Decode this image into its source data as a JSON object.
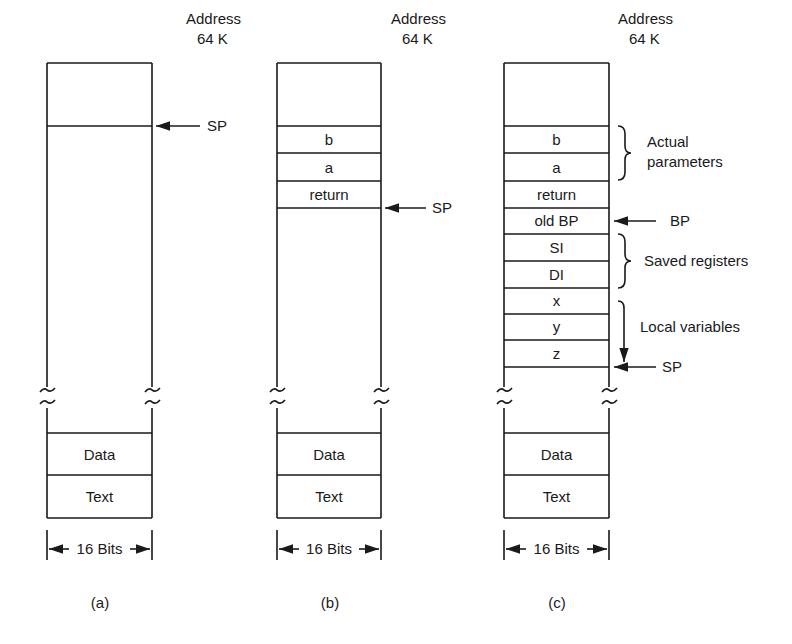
{
  "diagram": {
    "address_label": [
      "Address",
      "64 K"
    ],
    "width_label": "16 Bits",
    "panels": [
      {
        "id": "a",
        "caption": "(a)",
        "stack_cells": [],
        "sp_label": "SP",
        "bottom_cells": [
          "Data",
          "Text"
        ]
      },
      {
        "id": "b",
        "caption": "(b)",
        "stack_cells": [
          "b",
          "a",
          "return"
        ],
        "sp_label": "SP",
        "bottom_cells": [
          "Data",
          "Text"
        ]
      },
      {
        "id": "c",
        "caption": "(c)",
        "stack_cells": [
          "b",
          "a",
          "return",
          "old BP",
          "SI",
          "DI",
          "x",
          "y",
          "z"
        ],
        "sp_label": "SP",
        "bp_label": "BP",
        "annotations": {
          "actual_parameters": [
            "Actual",
            "parameters"
          ],
          "saved_registers": "Saved registers",
          "local_variables": "Local variables"
        },
        "bottom_cells": [
          "Data",
          "Text"
        ]
      }
    ]
  }
}
